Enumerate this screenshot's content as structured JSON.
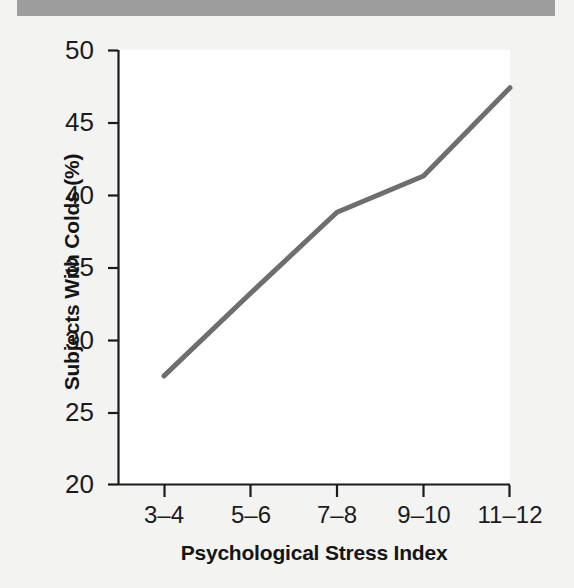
{
  "figure": {
    "header_band_color": "#9d9d9d",
    "background_color": "#f3f3f2",
    "plot_background_color": "#ffffff",
    "axis_color": "#1b1b1b",
    "line_color": "#6e6e6e"
  },
  "chart_data": {
    "type": "line",
    "title": "",
    "xlabel": "Psychological Stress Index",
    "ylabel": "Subjects With Colds (%)",
    "categories": [
      "3–4",
      "5–6",
      "7–8",
      "9–10",
      "11–12"
    ],
    "values": [
      27.5,
      33.2,
      38.8,
      41.3,
      47.4
    ],
    "series": [
      {
        "name": "Subjects With Colds (%)",
        "values": [
          27.5,
          33.2,
          38.8,
          41.3,
          47.4
        ]
      }
    ],
    "ylim": [
      20,
      50
    ],
    "yticks": [
      20,
      25,
      30,
      35,
      40,
      45,
      50
    ],
    "ytick_labels": [
      "20",
      "25",
      "30",
      "35",
      "40",
      "45",
      "50"
    ],
    "xtick_labels": [
      "3–4",
      "5–6",
      "7–8",
      "9–10",
      "11–12"
    ],
    "grid": false,
    "legend": false,
    "legend_position": "none",
    "line_color": "#6e6e6e",
    "line_width": 5,
    "markers": false
  }
}
